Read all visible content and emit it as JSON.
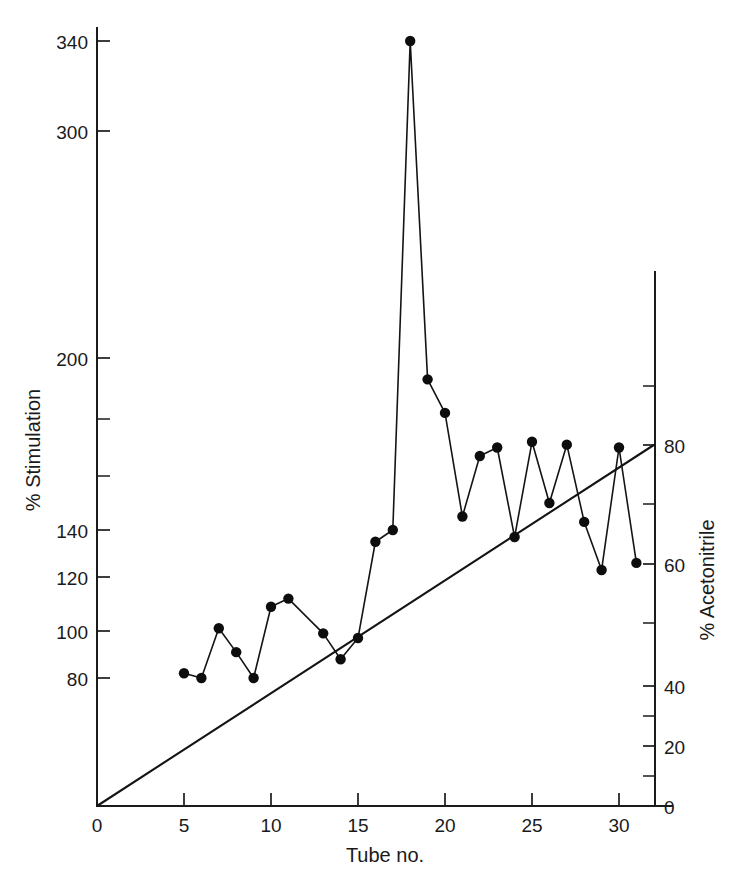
{
  "chart_data": {
    "type": "line",
    "title": "",
    "xlabel": "Tube no.",
    "ylabel": "% Stimulation",
    "y2label": "% Acetonitrile",
    "grid": false,
    "legend": "none",
    "xlim": [
      0,
      32
    ],
    "xticks": [
      0,
      5,
      10,
      15,
      20,
      25,
      30
    ],
    "xtick_labels": [
      "0",
      "5",
      "10",
      "15",
      "20",
      "25",
      "30"
    ],
    "y_axis_note": "non-linear (compressed above 140)",
    "yticks_labeled": [
      80,
      100,
      120,
      140,
      200,
      300,
      340
    ],
    "ytick_labels": [
      "80",
      "100",
      "120",
      "140",
      "200",
      "300",
      "340"
    ],
    "yticks_unlabeled": [
      160,
      180
    ],
    "y2lim": [
      0,
      90
    ],
    "y2ticks_labeled": [
      0,
      20,
      40,
      60,
      80
    ],
    "y2tick_labels": [
      "0",
      "20",
      "40",
      "60",
      "80"
    ],
    "y2ticks_unlabeled": [
      10,
      30,
      50,
      70,
      90
    ],
    "series": [
      {
        "name": "% Stimulation",
        "marker": "filled-circle",
        "x": [
          5,
          6,
          7,
          8,
          9,
          10,
          11,
          13,
          14,
          15,
          16,
          17,
          18,
          19,
          20,
          21,
          22,
          23,
          24,
          25,
          26,
          27,
          28,
          29,
          30,
          31
        ],
        "values": [
          82,
          80,
          101,
          91,
          75,
          109,
          112,
          99,
          88,
          97,
          135,
          140,
          340,
          193,
          182,
          145,
          167,
          170,
          137,
          172,
          150,
          171,
          143,
          123,
          170,
          126
        ]
      },
      {
        "name": "% Acetonitrile gradient",
        "marker": "none",
        "x": [
          0,
          32
        ],
        "values": [
          0,
          80
        ],
        "axis": "right"
      }
    ]
  }
}
